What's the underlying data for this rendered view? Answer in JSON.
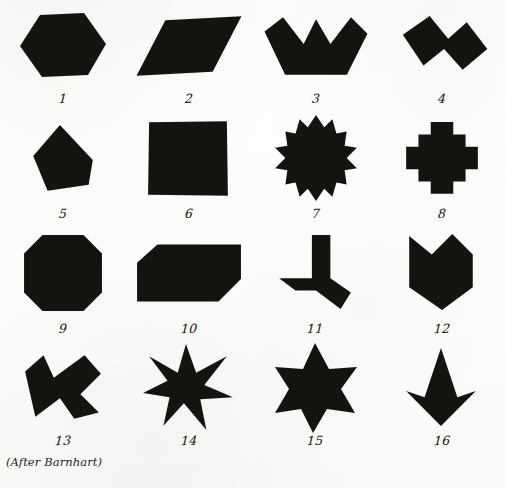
{
  "figure": {
    "credit": "(After Barnhart)",
    "background_color": "#fdfdfc",
    "ink_color": "#151310",
    "columns": 4,
    "rows": 4
  },
  "shapes": [
    {
      "number": "1",
      "label": "1",
      "name": "hexagon",
      "icon": "hexagon-shape-icon",
      "row": 1,
      "column": 1,
      "points": "26,6 70,4 92,35 74,66 28,68 6,37",
      "viewbox": "0 0 98 74"
    },
    {
      "number": "2",
      "label": "2",
      "name": "parallelogram",
      "icon": "parallelogram-shape-icon",
      "row": 1,
      "column": 2,
      "points": "30,10 104,6 76,60 2,64",
      "viewbox": "0 0 106 70"
    },
    {
      "number": "3",
      "label": "3",
      "name": "three-peaked-crown",
      "icon": "crown-shape-icon",
      "row": 1,
      "column": 3,
      "points": "2,20 20,6 40,32 52,8 66,32 86,6 102,22 82,62 22,62",
      "viewbox": "0 0 104 68"
    },
    {
      "number": "4",
      "label": "4",
      "name": "zigzag-z-polygon",
      "icon": "zigzag-shape-icon",
      "row": 1,
      "column": 4,
      "points": "12,22 38,4 56,26 74,10 94,36 70,56 52,36 32,52",
      "viewbox": "0 0 100 66"
    },
    {
      "number": "5",
      "label": "5",
      "name": "irregular-pentagon",
      "icon": "pentagon-shape-icon",
      "row": 2,
      "column": 1,
      "points": "34,4 66,38 62,62 22,68 8,34",
      "viewbox": "0 0 74 74"
    },
    {
      "number": "6",
      "label": "6",
      "name": "square",
      "icon": "square-shape-icon",
      "row": 2,
      "column": 2,
      "points": "4,4 80,3 81,76 3,75",
      "viewbox": "0 0 86 80"
    },
    {
      "number": "7",
      "label": "7",
      "name": "stepped-diamond",
      "icon": "stepped-diamond-shape-icon",
      "row": 2,
      "column": 3,
      "points": "30,0 38,12 46,4 50,18 60,16 58,30 70,32 60,42 70,52 58,54 60,68 50,66 46,80 38,72 30,84 22,72 14,80 10,66 0,68 2,54 -10,52 0,42 -10,32 2,30 0,16 10,18 14,4 22,12",
      "viewbox": "-12 -2 84 90"
    },
    {
      "number": "8",
      "label": "8",
      "name": "stepped-cross",
      "icon": "cross-shape-icon",
      "row": 2,
      "column": 4,
      "points": "30,2 52,2 52,14 64,14 64,26 76,26 76,48 64,48 64,60 52,60 52,72 30,72 30,60 18,60 18,48 6,48 6,26 18,26 18,14 30,14",
      "viewbox": "0 0 82 76"
    },
    {
      "number": "9",
      "label": "9",
      "name": "octagon",
      "icon": "octagon-shape-icon",
      "row": 3,
      "column": 1,
      "points": "20,2 60,2 78,20 78,58 60,76 20,76 2,58 2,20",
      "viewbox": "0 0 80 78"
    },
    {
      "number": "10",
      "label": "10",
      "name": "clipped-corner-rectangle",
      "icon": "clipped-rectangle-shape-icon",
      "row": 3,
      "column": 2,
      "points": "22,4 104,4 104,38 82,60 2,60 2,22",
      "viewbox": "0 0 106 64"
    },
    {
      "number": "11",
      "label": "11",
      "name": "three-pronged-pinwheel",
      "icon": "pinwheel-shape-icon",
      "row": 3,
      "column": 3,
      "points": "34,2 52,2 52,44 72,58 62,74 38,56 18,56 2,44 34,44",
      "viewbox": "0 0 76 78"
    },
    {
      "number": "12",
      "label": "12",
      "name": "down-chevron-arrow",
      "icon": "chevron-down-shape-icon",
      "row": 3,
      "column": 4,
      "points": "2,4 24,22 44,2 64,22 64,54 34,76 2,54",
      "viewbox": "0 0 68 80"
    },
    {
      "number": "13",
      "label": "13",
      "name": "bowtie-butterfly",
      "icon": "bowtie-shape-icon",
      "row": 4,
      "column": 1,
      "points": "4,18 22,2 32,24 62,2 78,20 58,40 76,58 52,64 38,44 14,62",
      "viewbox": "0 0 82 68"
    },
    {
      "number": "14",
      "label": "14",
      "name": "six-pointed-spiked-star",
      "icon": "star-six-spiked-icon",
      "row": 4,
      "column": 2,
      "points": "42,0 52,28 82,12 60,40 88,52 56,54 62,84 40,58 20,80 26,52 0,48 24,36 6,12 34,28",
      "viewbox": "0 0 90 86"
    },
    {
      "number": "15",
      "label": "15",
      "name": "hexagram-star-of-david",
      "icon": "star-of-david-icon",
      "row": 4,
      "column": 3,
      "points": "40,0 54,26 82,24 66,46 80,70 52,66 38,90 26,66 0,70 14,46 0,24 28,26",
      "viewbox": "-2 -2 86 94"
    },
    {
      "number": "16",
      "label": "16",
      "name": "kite-arrowhead",
      "icon": "kite-shape-icon",
      "row": 4,
      "column": 4,
      "points": "36,0 52,48 70,42 36,76 2,42 20,48",
      "viewbox": "0 0 74 78"
    }
  ]
}
